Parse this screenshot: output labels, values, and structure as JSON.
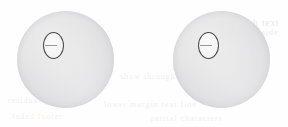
{
  "figure": {
    "caption": "",
    "background_color": "#fefefe",
    "width": 288,
    "height": 127
  },
  "objects": [
    {
      "id": "sphere-left",
      "label": "Left sphere",
      "shape": "circle",
      "center_x": 65,
      "center_y": 59,
      "diameter": 97,
      "fill_color": "#e4e4e6",
      "edge_color": "#d2d2d4"
    },
    {
      "id": "sphere-right",
      "label": "Right sphere",
      "shape": "circle",
      "center_x": 221,
      "center_y": 59,
      "diameter": 97,
      "fill_color": "#e4e4e6",
      "edge_color": "#d2d2d4"
    }
  ],
  "markers": [
    {
      "id": "marker-left",
      "label": "Left sphere marker ellipse",
      "shape": "ellipse",
      "center_x": 52,
      "center_y": 44,
      "width": 19,
      "height": 25,
      "outline_color": "#4a4a4a",
      "fill_color": "#f7f7f7"
    },
    {
      "id": "marker-right",
      "label": "Right sphere marker ellipse",
      "shape": "ellipse",
      "center_x": 207,
      "center_y": 44,
      "width": 19,
      "height": 25,
      "outline_color": "#4a4a4a",
      "fill_color": "#f7f7f7"
    }
  ],
  "ghost_text": {
    "description": "Faint bleed-through text from the reverse of the scanned page",
    "color": "#cfcfcf",
    "lines": [
      {
        "text": "bleed through text",
        "x": 196,
        "y": 18,
        "size": 9,
        "opacity": 0.5
      },
      {
        "text": "faint reverse side",
        "x": 206,
        "y": 28,
        "size": 8,
        "opacity": 0.42
      },
      {
        "text": "scanned page",
        "x": 182,
        "y": 46,
        "size": 8,
        "opacity": 0.38
      },
      {
        "text": "ghost line of type",
        "x": 172,
        "y": 62,
        "size": 8,
        "opacity": 0.35
      },
      {
        "text": "show through",
        "x": 120,
        "y": 72,
        "size": 8,
        "opacity": 0.33
      },
      {
        "text": "residual print",
        "x": 8,
        "y": 96,
        "size": 8,
        "opacity": 0.35
      },
      {
        "text": "lower margin text line",
        "x": 104,
        "y": 100,
        "size": 8,
        "opacity": 0.33
      },
      {
        "text": "faded footer",
        "x": 12,
        "y": 112,
        "size": 8,
        "opacity": 0.3
      },
      {
        "text": "partial characters",
        "x": 150,
        "y": 114,
        "size": 8,
        "opacity": 0.3
      }
    ]
  }
}
